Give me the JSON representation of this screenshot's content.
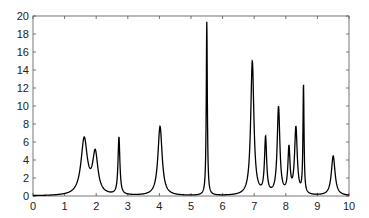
{
  "chart_data": {
    "type": "line",
    "title": "",
    "xlabel": "",
    "ylabel": "",
    "xlim": [
      0,
      10
    ],
    "ylim": [
      0,
      20
    ],
    "grid": false,
    "legend": null,
    "x_ticks": [
      "0",
      "1",
      "2",
      "3",
      "4",
      "5",
      "6",
      "7",
      "8",
      "9",
      "10"
    ],
    "y_ticks": [
      "0",
      "2",
      "4",
      "6",
      "8",
      "10",
      "12",
      "14",
      "16",
      "18",
      "20"
    ],
    "peaks": [
      {
        "x": 1.62,
        "height": 6.2,
        "width": 0.12
      },
      {
        "x": 1.97,
        "height": 4.5,
        "width": 0.1
      },
      {
        "x": 2.72,
        "height": 6.4,
        "width": 0.035
      },
      {
        "x": 4.02,
        "height": 7.7,
        "width": 0.08
      },
      {
        "x": 5.5,
        "height": 19.3,
        "width": 0.02
      },
      {
        "x": 6.94,
        "height": 14.9,
        "width": 0.06
      },
      {
        "x": 7.36,
        "height": 6.2,
        "width": 0.04
      },
      {
        "x": 7.77,
        "height": 9.7,
        "width": 0.05
      },
      {
        "x": 8.1,
        "height": 5.0,
        "width": 0.04
      },
      {
        "x": 8.32,
        "height": 7.4,
        "width": 0.05
      },
      {
        "x": 8.56,
        "height": 12.1,
        "width": 0.02
      },
      {
        "x": 9.5,
        "height": 4.4,
        "width": 0.07
      }
    ],
    "series": [
      {
        "name": "spectrum",
        "color": "#000000"
      }
    ]
  }
}
